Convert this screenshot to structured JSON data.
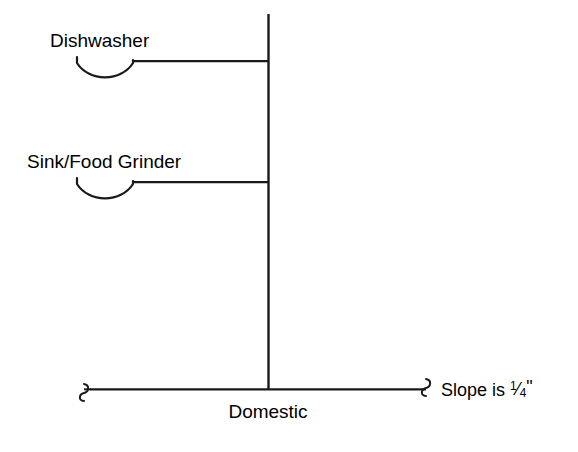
{
  "diagram": {
    "background_color": "#ffffff",
    "line_color": "#1a1a1a",
    "labels": {
      "dishwasher": "Dishwasher",
      "sink_food_grinder": "Sink/Food Grinder",
      "domestic": "Domestic",
      "slope_prefix": "Slope is ",
      "slope_numerator": "1",
      "slope_solidus": "⁄",
      "slope_denominator": "4",
      "slope_unit": "\""
    },
    "fixtures": [
      {
        "name": "dishwasher",
        "label": "Dishwasher",
        "trap_type": "p-trap",
        "branch_y": 62
      },
      {
        "name": "sink-food-grinder",
        "label": "Sink/Food Grinder",
        "trap_type": "p-trap",
        "branch_y": 183
      }
    ],
    "stack": {
      "name": "vertical-waste-stack",
      "x": 268,
      "top_y": 14,
      "bottom_y": 389
    },
    "building_drain": {
      "name": "domestic-building-drain",
      "y": 389,
      "left_x": 85,
      "right_x": 430,
      "break_symbol": "s-curve",
      "slope": "1/4\""
    }
  }
}
